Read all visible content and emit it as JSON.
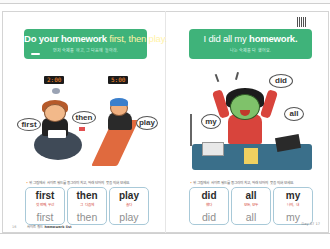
{
  "left_page": {
    "banner": {
      "prefix": "Do your homework ",
      "highlight": "first, then play.",
      "subtitle": "먼저 숙제를 하고, 그 다음에 놀아라."
    },
    "clocks": [
      "2:00",
      "5:00"
    ],
    "bubbles": [
      "first",
      "then",
      "play"
    ],
    "instruction_mark": "•",
    "instruction": "위 그림에서 사이트 워드를 동그라미 치고, 아래 단어의 뜻을 익혀 보세요.",
    "cards": [
      {
        "word": "first",
        "meaning": "첫 번째, 우선",
        "trace": "first"
      },
      {
        "word": "then",
        "meaning": "그 다음에",
        "trace": "then"
      },
      {
        "word": "play",
        "meaning": "놀다",
        "trace": "play"
      }
    ],
    "footer": {
      "page_number": "16",
      "source_label": "사이트 워드 ",
      "source_bold": "homework list"
    }
  },
  "right_page": {
    "banner": {
      "prefix": "I did all my ",
      "highlight": "homework.",
      "subtitle": "나는 숙제를 다 했어요."
    },
    "bubbles": [
      "did",
      "all",
      "my"
    ],
    "instruction_mark": "•",
    "instruction": "위 그림에서 사이트 워드를 동그라미 치고, 아래 단어의 뜻을 익혀 보세요.",
    "cards": [
      {
        "word": "did",
        "meaning": "했다",
        "trace": "did"
      },
      {
        "word": "all",
        "meaning": "모든, 모두",
        "trace": "all"
      },
      {
        "word": "my",
        "meaning": "나의, 내",
        "trace": "my"
      }
    ],
    "footer": {
      "day_label": "Day 07 17"
    }
  },
  "colors": {
    "banner_green": "#3fb37a",
    "accent_orange": "#f0832f",
    "card_border": "#a8c9d8",
    "meaning_red": "#d4483a"
  }
}
